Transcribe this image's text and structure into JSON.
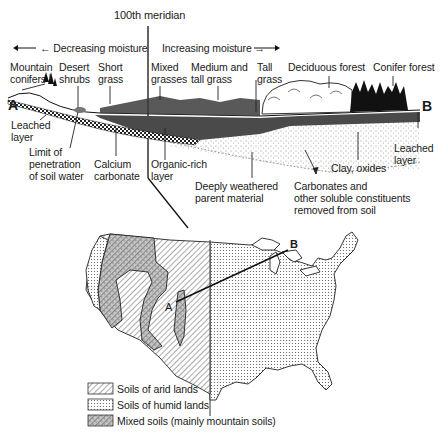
{
  "title": "100th meridian",
  "moisture": {
    "decreasing": "← Decreasing moisture",
    "increasing": "Increasing moisture →"
  },
  "endpoints": {
    "a": "A",
    "b": "B"
  },
  "vegetation_labels": [
    {
      "line1": "Mountain",
      "line2": "conifers"
    },
    {
      "line1": "Desert",
      "line2": "shrubs"
    },
    {
      "line1": "Short",
      "line2": "grass"
    },
    {
      "line1": "Mixed",
      "line2": "grasses"
    },
    {
      "line1": "Medium and",
      "line2": "tall grass"
    },
    {
      "line1": "Tall",
      "line2": "grass"
    },
    {
      "line1": "Deciduous forest",
      "line2": ""
    },
    {
      "line1": "Conifer forest",
      "line2": ""
    }
  ],
  "soil_labels": [
    {
      "line1": "Leached",
      "line2": "layer"
    },
    {
      "line1": "Limit of",
      "line2": "penetration",
      "line3": "of soil water"
    },
    {
      "line1": "Calcium",
      "line2": "carbonate"
    },
    {
      "line1": "Organic-rich",
      "line2": "layer"
    },
    {
      "line1": "Deeply weathered",
      "line2": "parent material"
    },
    {
      "line1": "Clay, oxides"
    },
    {
      "line1": "Carbonates and",
      "line2": "other soluble constituents",
      "line3": "removed from soil"
    },
    {
      "line1": "Leached",
      "line2": "layer"
    }
  ],
  "legend": [
    {
      "label": "Soils of arid lands",
      "pattern": "diagonal-hatch"
    },
    {
      "label": "Soils of humid lands",
      "pattern": "dots"
    },
    {
      "label": "Mixed soils (mainly mountain soils)",
      "pattern": "hatch-dots"
    }
  ]
}
